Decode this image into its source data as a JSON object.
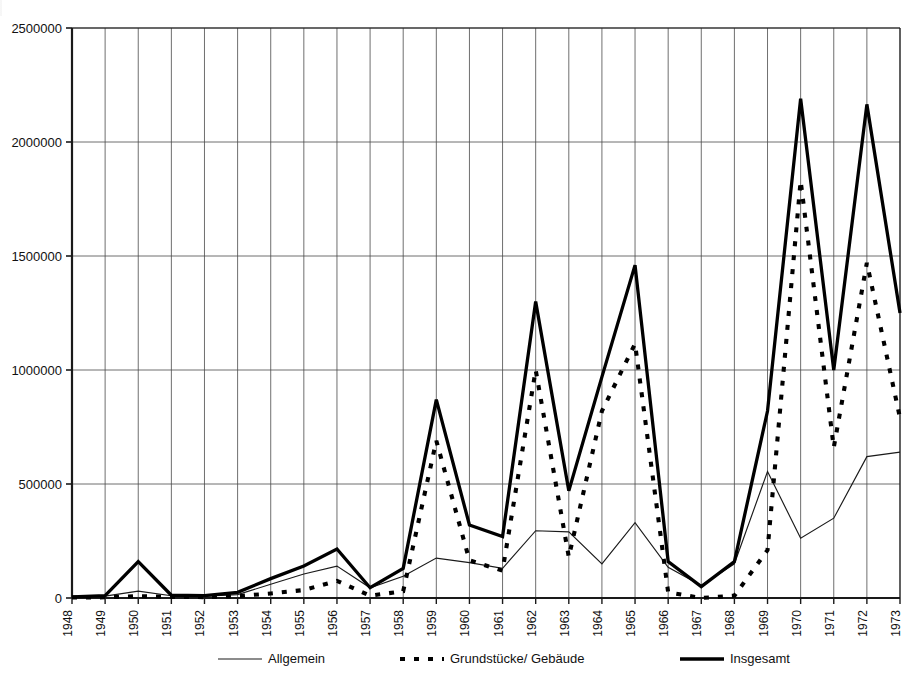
{
  "chart_data": {
    "type": "line",
    "title": "",
    "subtitle": "",
    "xlabel": "",
    "ylabel": "",
    "grid": true,
    "legend_position": "bottom",
    "x": [
      1948,
      1949,
      1950,
      1951,
      1952,
      1953,
      1954,
      1955,
      1956,
      1957,
      1958,
      1959,
      1960,
      1961,
      1962,
      1963,
      1964,
      1965,
      1966,
      1967,
      1968,
      1969,
      1970,
      1971,
      1972,
      1973
    ],
    "xtick_labels": [
      "1948",
      "1949",
      "1950",
      "1951",
      "1952",
      "1953",
      "1954",
      "1955",
      "1956",
      "1957",
      "1958",
      "1959",
      "1960",
      "1961",
      "1962",
      "1963",
      "1964",
      "1965",
      "1966",
      "1967",
      "1968",
      "1969",
      "1970",
      "1971",
      "1972",
      "1973"
    ],
    "ytick_labels": [
      "0",
      "500000",
      "1000000",
      "1500000",
      "2000000",
      "2500000"
    ],
    "yticks": [
      0,
      500000,
      1000000,
      1500000,
      2000000,
      2500000
    ],
    "ylim": [
      0,
      2500000
    ],
    "xlim": [
      1948,
      1973
    ],
    "series": [
      {
        "name": "Allgemein",
        "style": "thin-solid",
        "values": [
          5000,
          8000,
          30000,
          10000,
          8000,
          15000,
          60000,
          105000,
          140000,
          45000,
          95000,
          175000,
          155000,
          130000,
          295000,
          290000,
          150000,
          330000,
          135000,
          55000,
          150000,
          555000,
          262000,
          350000,
          620000,
          640000
        ]
      },
      {
        "name": "Grundstücke/ Gebäude",
        "style": "dotted",
        "values": [
          2000,
          3000,
          8000,
          5000,
          4000,
          8000,
          20000,
          35000,
          75000,
          10000,
          30000,
          690000,
          165000,
          120000,
          1000000,
          180000,
          820000,
          1115000,
          25000,
          -10000,
          10000,
          210000,
          1830000,
          660000,
          1470000,
          790000
        ]
      },
      {
        "name": "Insgesamt",
        "style": "thick-solid",
        "values": [
          5000,
          10000,
          160000,
          12000,
          10000,
          25000,
          85000,
          140000,
          215000,
          45000,
          130000,
          870000,
          320000,
          270000,
          1300000,
          470000,
          970000,
          1460000,
          160000,
          50000,
          160000,
          820000,
          2190000,
          1000000,
          2165000,
          1250000
        ]
      }
    ],
    "legend": [
      {
        "label": "Allgemein",
        "style": "thin-solid"
      },
      {
        "label": "Grundstücke/ Gebäude",
        "style": "dotted"
      },
      {
        "label": "Insgesamt",
        "style": "thick-solid"
      }
    ]
  }
}
